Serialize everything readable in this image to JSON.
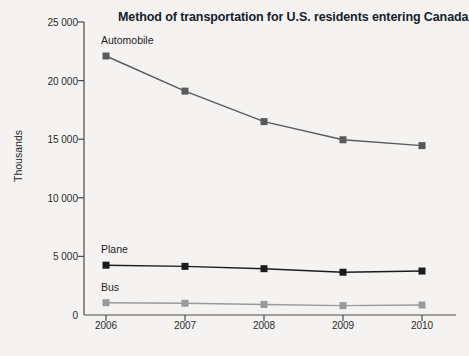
{
  "chart_data": {
    "type": "line",
    "title": "Method of transportation for U.S. residents entering Canada",
    "xlabel": "",
    "ylabel": "Thousands",
    "categories": [
      "2006",
      "2007",
      "2008",
      "2009",
      "2010"
    ],
    "x": [
      2006,
      2007,
      2008,
      2009,
      2010
    ],
    "ylim": [
      0,
      25000
    ],
    "yticks": [
      0,
      5000,
      10000,
      15000,
      20000,
      25000
    ],
    "ytick_labels": [
      "0",
      "5 000",
      "10 000",
      "15 000",
      "20 000",
      "25 000"
    ],
    "grid": false,
    "legend": "inline-labels",
    "series": [
      {
        "name": "Automobile",
        "values": [
          22100,
          19100,
          16500,
          14950,
          14450
        ],
        "color": "#5a5a5a",
        "marker": "square"
      },
      {
        "name": "Plane",
        "values": [
          4250,
          4150,
          3950,
          3650,
          3750
        ],
        "color": "#1b1b1b",
        "marker": "square"
      },
      {
        "name": "Bus",
        "values": [
          1050,
          1000,
          900,
          800,
          850
        ],
        "color": "#9a9a9a",
        "marker": "square"
      }
    ],
    "annotations": [
      {
        "text": "Automobile",
        "x": 2006,
        "y": 22100
      },
      {
        "text": "Plane",
        "x": 2006,
        "y": 4250
      },
      {
        "text": "Bus",
        "x": 2006,
        "y": 1050
      }
    ]
  },
  "colors": {
    "page_background": "#f4f3f1",
    "axis": "#4a4a4a",
    "title": "#16212b"
  }
}
